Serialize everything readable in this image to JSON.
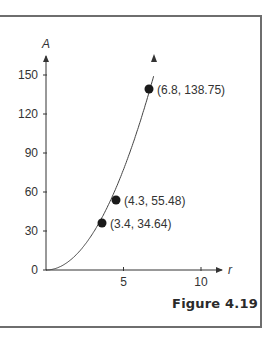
{
  "figure": {
    "caption": "Figure 4.19"
  },
  "chart_data": {
    "type": "line",
    "title": "",
    "xlabel": "r",
    "ylabel": "A",
    "xlim": [
      0,
      11
    ],
    "ylim": [
      0,
      165
    ],
    "x_ticks": [
      5,
      10
    ],
    "x_tick_labels": [
      "5",
      "10"
    ],
    "y_ticks": [
      0,
      30,
      60,
      90,
      120,
      150
    ],
    "y_tick_labels": [
      "0",
      "30",
      "60",
      "90",
      "120",
      "150"
    ],
    "grid": false,
    "legend": null,
    "series": [
      {
        "name": "A(r) curve",
        "x": [
          0,
          1,
          2,
          3,
          3.4,
          4,
          4.3,
          5,
          6,
          6.8,
          7.0
        ],
        "y": [
          0,
          3,
          12,
          27,
          34.64,
          48,
          55.48,
          75,
          108,
          138.75,
          150
        ]
      }
    ],
    "points": [
      {
        "x": 3.4,
        "y": 34.64,
        "label": "(3.4, 34.64)"
      },
      {
        "x": 4.3,
        "y": 55.48,
        "label": "(4.3, 55.48)"
      },
      {
        "x": 6.8,
        "y": 138.75,
        "label": "(6.8, 138.75)"
      }
    ]
  }
}
